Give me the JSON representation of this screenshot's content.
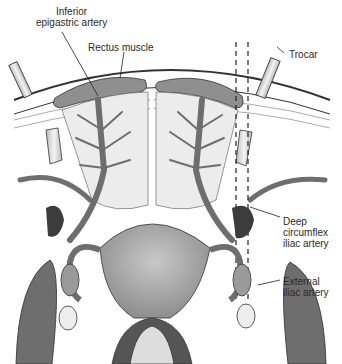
{
  "figure": {
    "type": "anatomical illustration",
    "labels": [
      {
        "id": "inferior_epigastric",
        "text": "Inferior\nepigastric artery"
      },
      {
        "id": "rectus",
        "text": "Rectus muscle"
      },
      {
        "id": "trocar",
        "text": "Trocar"
      },
      {
        "id": "deep_circumflex",
        "text": "Deep\ncircumflex\niliac artery"
      },
      {
        "id": "external_iliac",
        "text": "External\niliac artery"
      }
    ]
  },
  "colors": {
    "vessel": "#7d7d7d",
    "vessel_dark": "#4a4a4a",
    "muscle": "#e6e6e6",
    "uterus": "#a9a9a9",
    "outline": "#222222",
    "background": "#ffffff"
  }
}
